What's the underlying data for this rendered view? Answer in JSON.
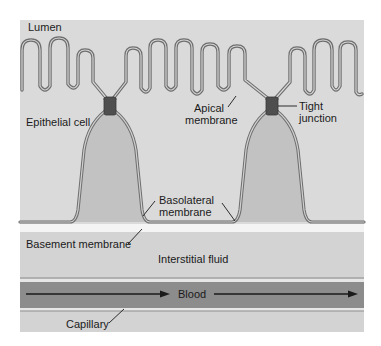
{
  "labels": {
    "lumen": "Lumen",
    "epithelial_cell": "Epithelial cell",
    "apical_membrane_line1": "Apical",
    "apical_membrane_line2": "membrane",
    "tight_junction_line1": "Tight",
    "tight_junction_line2": "junction",
    "basolateral_membrane_line1": "Basolateral",
    "basolateral_membrane_line2": "membrane",
    "basement_membrane": "Basement membrane",
    "interstitial_fluid": "Interstitial fluid",
    "blood": "Blood",
    "capillary": "Capillary"
  },
  "colors": {
    "panel_bg": "#d6d6d6",
    "lumen_bg": "#dcdcdc",
    "cell_fill": "#c4c4c4",
    "membrane_stroke": "#777777",
    "junction": "#555555",
    "basement_gap": "#f4f4f4",
    "interstitial": "#cfcfcf",
    "capillary_wall": "#bdbdbd",
    "blood": "#8a8a8a",
    "arrow": "#1a1a1a"
  }
}
